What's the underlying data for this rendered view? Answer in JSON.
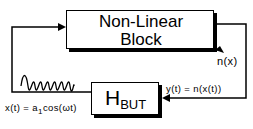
{
  "nonlinear_block": {
    "line1": "Non-Linear",
    "line2": "Block",
    "icon": "piecewise-linear-icon"
  },
  "hbut_block": {
    "main": "H",
    "subscript": "BUT"
  },
  "labels": {
    "n_of_x": "n(x)",
    "output": "y(t) = n(x(t))",
    "input_prefix": "x(t) = a",
    "input_sub": "1",
    "input_suffix": "cos(ωt)"
  },
  "icons": {
    "sine_wave": "sine-wave-icon",
    "arrows": "arrow-icon"
  },
  "colors": {
    "line": "#000000",
    "background": "#ffffff",
    "shadow": "#000000"
  }
}
